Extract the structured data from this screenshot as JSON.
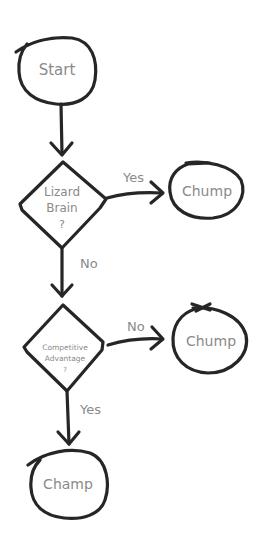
{
  "diagram": {
    "type": "flowchart",
    "style": "hand-drawn",
    "colors": {
      "stroke": "#262626",
      "text": "#8a8a8a",
      "background": "#ffffff"
    },
    "nodes": {
      "start": {
        "shape": "circle",
        "label": "Start"
      },
      "lizard": {
        "shape": "diamond",
        "line1": "Lizard",
        "line2": "Brain",
        "line3": "?"
      },
      "chump1": {
        "shape": "circle",
        "label": "Chump"
      },
      "competitive": {
        "shape": "diamond",
        "line1": "Competitive",
        "line2": "Advantage",
        "line3": "?"
      },
      "chump2": {
        "shape": "circle",
        "label": "Chump"
      },
      "champ": {
        "shape": "circle",
        "label": "Champ"
      }
    },
    "edges": {
      "e1": {
        "from": "start",
        "to": "lizard",
        "label": ""
      },
      "e2": {
        "from": "lizard",
        "to": "chump1",
        "label": "Yes"
      },
      "e3": {
        "from": "lizard",
        "to": "competitive",
        "label": "No"
      },
      "e4": {
        "from": "competitive",
        "to": "chump2",
        "label": "No"
      },
      "e5": {
        "from": "competitive",
        "to": "champ",
        "label": "Yes"
      }
    }
  }
}
